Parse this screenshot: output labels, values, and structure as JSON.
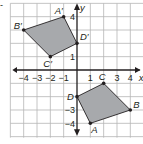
{
  "diagram": {
    "type": "coordinate-plane",
    "marker": "-",
    "grid": {
      "xmin": -5,
      "xmax": 5,
      "ymin": -5,
      "ymax": 5,
      "unit_px": 13.33,
      "origin_px": [
        77,
        70
      ]
    },
    "axes": {
      "x_label": "x",
      "y_label": "y"
    },
    "x_ticks": [
      {
        "value": -4,
        "label": "−4"
      },
      {
        "value": -3,
        "label": "−3"
      },
      {
        "value": -2,
        "label": "−2"
      },
      {
        "value": -1,
        "label": "−1"
      },
      {
        "value": 1,
        "label": "1"
      },
      {
        "value": 3,
        "label": "3"
      },
      {
        "value": 4,
        "label": "4"
      }
    ],
    "y_ticks": [
      {
        "value": 4,
        "label": "4"
      },
      {
        "value": 1,
        "label": "1"
      },
      {
        "value": -3,
        "label": "−3"
      },
      {
        "value": -4,
        "label": "−4"
      }
    ],
    "colors": {
      "grid": "#b5b5b5",
      "axis": "#231f20",
      "fill": "#a7a9ac",
      "stroke": "#231f20"
    },
    "shapes": [
      {
        "name": "original",
        "vertices": [
          {
            "label": "A",
            "x": 1,
            "y": -4
          },
          {
            "label": "B",
            "x": 4,
            "y": -3
          },
          {
            "label": "C",
            "x": 2,
            "y": -1
          },
          {
            "label": "D",
            "x": 0,
            "y": -2
          }
        ]
      },
      {
        "name": "image",
        "vertices": [
          {
            "label": "A′",
            "x": -1,
            "y": 4
          },
          {
            "label": "B′",
            "x": -4,
            "y": 3
          },
          {
            "label": "C′",
            "x": -2,
            "y": 1
          },
          {
            "label": "D′",
            "x": 0,
            "y": 2
          }
        ]
      }
    ]
  }
}
